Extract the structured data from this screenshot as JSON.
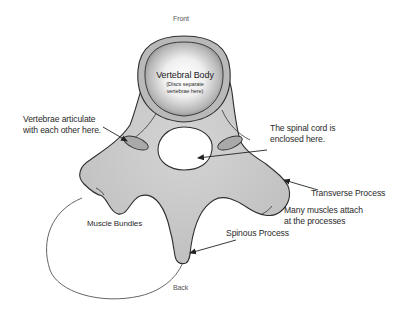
{
  "diagram": {
    "orientation": {
      "top": "Front",
      "bottom": "Back"
    },
    "labels": {
      "vertebral_body": "Vertebral Body",
      "vertebral_body_note_line1": "(Discs separate",
      "vertebral_body_note_line2": "vertebrae here)",
      "articulate_line1": "Vertebrae articulate",
      "articulate_line2": "with each other here.",
      "spinal_cord_line1": "The spinal cord is",
      "spinal_cord_line2": "enclosed here.",
      "transverse_process": "Transverse Process",
      "muscles_line1": "Many muscles attach",
      "muscles_line2": "at the processes",
      "muscle_bundles": "Muscle Bundles",
      "spinous_process": "Spinous Process"
    },
    "colors": {
      "bone_fill": "#c8c8c8",
      "outline": "#333333",
      "body_highlight": "#ffffff",
      "body_shadow": "#8a8a8a",
      "background": "#ffffff"
    }
  }
}
